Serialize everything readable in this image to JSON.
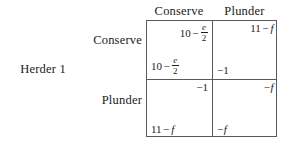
{
  "figure": {
    "type": "normal-form-game-payoff-matrix",
    "row_player_label": "Herder 1",
    "row_strategies": [
      "Conserve",
      "Plunder"
    ],
    "column_strategies": [
      "Conserve",
      "Plunder"
    ],
    "cells": [
      {
        "row": "Conserve",
        "column": "Conserve",
        "row_payoff_text": "10 − e/2",
        "column_payoff_text": "10 − e/2",
        "row_payoff": {
          "integer": "10",
          "operator": "−",
          "numerator": "e",
          "denominator": "2"
        },
        "column_payoff": {
          "integer": "10",
          "operator": "−",
          "numerator": "e",
          "denominator": "2"
        }
      },
      {
        "row": "Conserve",
        "column": "Plunder",
        "row_payoff_text": "−1",
        "column_payoff_text": "11 − f",
        "row_payoff": {
          "sign": "−",
          "integer": "1"
        },
        "column_payoff": {
          "integer": "11",
          "operator": "−",
          "variable": "f"
        }
      },
      {
        "row": "Plunder",
        "column": "Conserve",
        "row_payoff_text": "11 − f",
        "column_payoff_text": "−1",
        "row_payoff": {
          "integer": "11",
          "operator": "−",
          "variable": "f"
        },
        "column_payoff": {
          "sign": "−",
          "integer": "1"
        }
      },
      {
        "row": "Plunder",
        "column": "Plunder",
        "row_payoff_text": "−f",
        "column_payoff_text": "−f",
        "row_payoff": {
          "sign": "−",
          "variable": "f"
        },
        "column_payoff": {
          "sign": "−",
          "variable": "f"
        }
      }
    ]
  },
  "colors": {
    "background": "#ffffff",
    "text": "#1b1b1b",
    "grid_line": "#595959"
  }
}
